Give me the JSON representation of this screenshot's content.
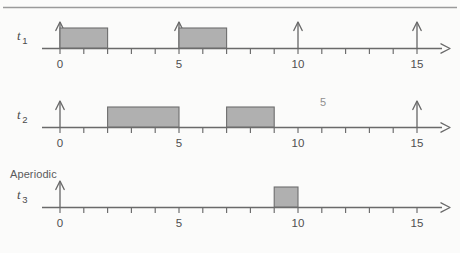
{
  "figure": {
    "title": "",
    "top_rule": true,
    "background_color": "#fbfbfa",
    "block_fill_color": "#b0b0b0",
    "block_stroke_color": "#6e6e6e",
    "axis_color": "#6a6a6a",
    "text_color": "#4f4f4f"
  },
  "labels": {
    "t1": "t",
    "t1_sub": "1",
    "t2": "t",
    "t2_sub": "2",
    "t3": "t",
    "t3_sub": "3",
    "aperiodic": "Aperiodic",
    "stray_five": "5"
  },
  "axis": {
    "t_min": 0,
    "t_max": 16,
    "tick_step": 1,
    "label_step": 5,
    "tick_labels": [
      "0",
      "5",
      "10",
      "15"
    ],
    "tick_label_values": [
      0,
      5,
      10,
      15
    ],
    "end_arrow": true
  },
  "chart_data": {
    "type": "timeline",
    "title": "",
    "xlabel": "",
    "ylabel": "",
    "xlim": [
      0,
      16
    ],
    "grid": false,
    "legend": "none",
    "tick_step": 1,
    "labeled_ticks": [
      0,
      5,
      10,
      15
    ],
    "series": [
      {
        "name": "t1",
        "label": "t",
        "subscript": "1",
        "group": "",
        "arrivals": [
          0,
          5,
          10,
          15
        ],
        "blocks": [
          {
            "start": 0,
            "end": 2
          },
          {
            "start": 5,
            "end": 7
          }
        ]
      },
      {
        "name": "t2",
        "label": "t",
        "subscript": "2",
        "group": "",
        "arrivals": [
          0,
          15
        ],
        "blocks": [
          {
            "start": 2,
            "end": 5
          },
          {
            "start": 7,
            "end": 9
          }
        ]
      },
      {
        "name": "t3",
        "label": "t",
        "subscript": "3",
        "group": "Aperiodic",
        "arrivals": [
          0
        ],
        "blocks": [
          {
            "start": 9,
            "end": 10
          }
        ]
      }
    ]
  }
}
